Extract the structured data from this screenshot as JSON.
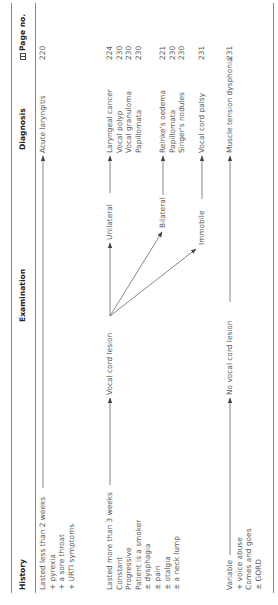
{
  "table": {
    "headers": {
      "history": "History",
      "examination": "Examination",
      "diagnosis": "Diagnosis",
      "page_no": "Page no.",
      "page_icon": "book-icon"
    },
    "rows": [
      {
        "history": [
          "Lasted less than 2 weeks",
          "+ pyrexia",
          "+ a sore throat",
          "+ URTI symptoms"
        ],
        "examination": "",
        "diagnoses": [
          {
            "name": "Acute laryngitis",
            "page": "220"
          }
        ]
      },
      {
        "history": [
          "Lasted more than 3 weeks",
          "Constant",
          "Progressive",
          "Patient is a smoker",
          "± dysphagia",
          "± pain",
          "± otalgia",
          "± a neck lump"
        ],
        "examination": "Vocal cord lesion",
        "branches": [
          {
            "label": "Unilateral",
            "diagnoses": [
              {
                "name": "Laryngeal cancer",
                "page": "224"
              },
              {
                "name": "Vocal polyp",
                "page": "230"
              },
              {
                "name": "Vocal granuloma",
                "page": "230"
              },
              {
                "name": "Papillomata",
                "page": "230"
              }
            ]
          },
          {
            "label": "Bilateral",
            "diagnoses": [
              {
                "name": "Reinke's oedema",
                "page": "221"
              },
              {
                "name": "Papillomata",
                "page": "230"
              },
              {
                "name": "Singer's nodules",
                "page": "230"
              }
            ]
          },
          {
            "label": "Immobile",
            "diagnoses": [
              {
                "name": "Vocal cord palsy",
                "page": "231"
              }
            ]
          }
        ]
      },
      {
        "history": [
          "Variable",
          "+ voice abuse",
          "Comes and goes",
          "± GORD"
        ],
        "examination": "No vocal cord lesion",
        "diagnoses": [
          {
            "name": "Muscle tension dysphonia",
            "page": "231"
          }
        ]
      }
    ]
  },
  "colors": {
    "rule": "#888888",
    "header_text": "#222222",
    "body_text": "#5a5a5a",
    "arrow": "#444444"
  }
}
